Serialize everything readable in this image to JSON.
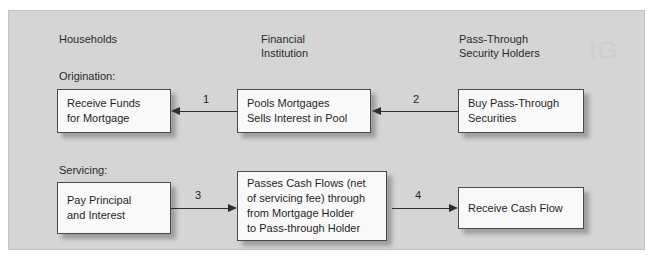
{
  "panel": {
    "background_color": "#d5d5d5",
    "border_color": "#c3c3c3"
  },
  "watermark": {
    "text": "IG"
  },
  "columns": [
    {
      "label": "Households"
    },
    {
      "label": "Financial\nInstitution"
    },
    {
      "label": "Pass-Through\nSecurity Holders"
    }
  ],
  "sections": [
    {
      "label": "Origination:"
    },
    {
      "label": "Servicing:"
    }
  ],
  "nodes": [
    {
      "id": "receive-funds",
      "text": "Receive Funds\nfor Mortgage"
    },
    {
      "id": "pools-mortgages",
      "text": "Pools Mortgages\nSells Interest in Pool"
    },
    {
      "id": "buy-pass-through",
      "text": "Buy Pass-Through\nSecurities"
    },
    {
      "id": "pay-principal",
      "text": "Pay Principal\nand Interest"
    },
    {
      "id": "passes-cash-flows",
      "text": "Passes Cash Flows (net\nof servicing fee) through\nfrom Mortgage Holder\nto Pass-through Holder"
    },
    {
      "id": "receive-cash-flow",
      "text": "Receive Cash Flow"
    }
  ],
  "arrows": [
    {
      "id": "arrow-1",
      "label": "1",
      "direction": "left",
      "from": "pools-mortgages",
      "to": "receive-funds"
    },
    {
      "id": "arrow-2",
      "label": "2",
      "direction": "left",
      "from": "buy-pass-through",
      "to": "pools-mortgages"
    },
    {
      "id": "arrow-3",
      "label": "3",
      "direction": "right",
      "from": "pay-principal",
      "to": "passes-cash-flows"
    },
    {
      "id": "arrow-4",
      "label": "4",
      "direction": "right",
      "from": "passes-cash-flows",
      "to": "receive-cash-flow"
    }
  ],
  "colors": {
    "box_fill": "#f9f9f9",
    "box_border": "#4a4a4a",
    "text": "#1f1f1f",
    "arrow": "#2e2e2e"
  }
}
